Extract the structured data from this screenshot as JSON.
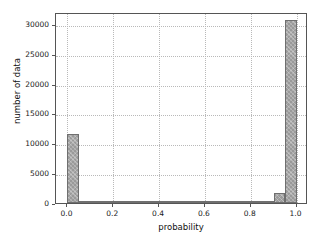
{
  "chart_data": {
    "type": "bar",
    "title": "",
    "subtitle": "",
    "xlabel": "probability",
    "ylabel": "number of data",
    "xlim": [
      -0.05,
      1.05
    ],
    "ylim": [
      0,
      32000
    ],
    "grid": true,
    "legend": null,
    "bin_width": 0.05,
    "xticks": [
      "0.0",
      "0.2",
      "0.4",
      "0.6",
      "0.8",
      "1.0"
    ],
    "xtick_values": [
      0.0,
      0.2,
      0.4,
      0.6,
      0.8,
      1.0
    ],
    "yticks": [
      "0",
      "5000",
      "10000",
      "15000",
      "20000",
      "25000",
      "30000"
    ],
    "ytick_values": [
      0,
      5000,
      10000,
      15000,
      20000,
      25000,
      30000
    ],
    "bin_edges": [
      0.0,
      0.05,
      0.1,
      0.15,
      0.2,
      0.25,
      0.3,
      0.35,
      0.4,
      0.45,
      0.5,
      0.55,
      0.6,
      0.65,
      0.7,
      0.75,
      0.8,
      0.85,
      0.9,
      0.95,
      1.0
    ],
    "categories": [
      "0.00-0.05",
      "0.05-0.10",
      "0.10-0.15",
      "0.15-0.20",
      "0.20-0.25",
      "0.25-0.30",
      "0.30-0.35",
      "0.35-0.40",
      "0.40-0.45",
      "0.45-0.50",
      "0.50-0.55",
      "0.55-0.60",
      "0.60-0.65",
      "0.65-0.70",
      "0.70-0.75",
      "0.75-0.80",
      "0.80-0.85",
      "0.85-0.90",
      "0.90-0.95",
      "0.95-1.00"
    ],
    "values": [
      11500,
      300,
      90,
      60,
      50,
      40,
      40,
      40,
      40,
      40,
      40,
      40,
      40,
      50,
      50,
      60,
      80,
      330,
      1600,
      30700
    ],
    "bar_color": "#9a9a9a",
    "bar_edge_color": "#6f6f6f",
    "grid_color": "#b9b9b9",
    "axis_color": "#555555",
    "background_color": "#ffffff"
  }
}
